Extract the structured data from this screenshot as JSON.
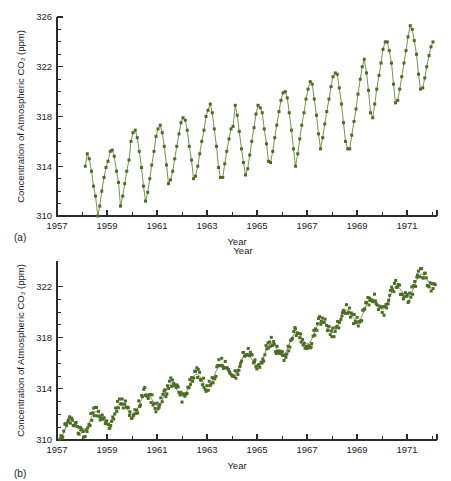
{
  "figure": {
    "panel_a_tag": "(a)",
    "panel_b_tag": "(b)",
    "marker_color": "#4e6b26",
    "line_color": "#5e7f30",
    "axis_color": "#2b2b2b"
  },
  "chart_data": [
    {
      "type": "scatter",
      "panel": "(a)",
      "title": "",
      "xlabel": "Year",
      "ylabel": "Concentration of Atmospheric CO2 (ppm)",
      "ylabel_display": "Concentration of Atmospheric CO₂ (ppm)",
      "xlim": [
        1957,
        1972.2
      ],
      "ylim": [
        310,
        326
      ],
      "ytick_labels": [
        "310",
        "314",
        "318",
        "322",
        "326"
      ],
      "yticks": [
        310,
        314,
        318,
        322,
        326
      ],
      "ytick_minor_step": 1,
      "xtick_labels": [
        "1957",
        "1959",
        "1961",
        "1963",
        "1965",
        "1967",
        "1969",
        "1971"
      ],
      "xticks": [
        1957,
        1959,
        1961,
        1963,
        1965,
        1967,
        1969,
        1971
      ],
      "xtick_minor_step": 1,
      "grid": false,
      "legend": "none",
      "series_name": "Monthly mean CO2",
      "connected": true,
      "x": [
        1958.13,
        1958.21,
        1958.29,
        1958.38,
        1958.46,
        1958.54,
        1958.63,
        1958.71,
        1958.79,
        1958.88,
        1958.96,
        1959.04,
        1959.13,
        1959.21,
        1959.29,
        1959.38,
        1959.46,
        1959.54,
        1959.63,
        1959.71,
        1959.79,
        1959.88,
        1959.96,
        1960.04,
        1960.13,
        1960.21,
        1960.29,
        1960.38,
        1960.46,
        1960.54,
        1960.63,
        1960.71,
        1960.79,
        1960.88,
        1960.96,
        1961.04,
        1961.13,
        1961.21,
        1961.29,
        1961.38,
        1961.46,
        1961.54,
        1961.63,
        1961.71,
        1961.79,
        1961.88,
        1961.96,
        1962.04,
        1962.13,
        1962.21,
        1962.29,
        1962.38,
        1962.46,
        1962.54,
        1962.63,
        1962.71,
        1962.79,
        1962.88,
        1962.96,
        1963.04,
        1963.13,
        1963.21,
        1963.29,
        1963.38,
        1963.46,
        1963.54,
        1963.63,
        1963.71,
        1963.79,
        1963.88,
        1963.96,
        1964.04,
        1964.13,
        1964.21,
        1964.29,
        1964.38,
        1964.46,
        1964.54,
        1964.63,
        1964.71,
        1964.79,
        1964.88,
        1964.96,
        1965.04,
        1965.13,
        1965.21,
        1965.29,
        1965.38,
        1965.46,
        1965.54,
        1965.63,
        1965.71,
        1965.79,
        1965.88,
        1965.96,
        1966.04,
        1966.13,
        1966.21,
        1966.29,
        1966.38,
        1966.46,
        1966.54,
        1966.63,
        1966.71,
        1966.79,
        1966.88,
        1966.96,
        1967.04,
        1967.13,
        1967.21,
        1967.29,
        1967.38,
        1967.46,
        1967.54,
        1967.63,
        1967.71,
        1967.79,
        1967.88,
        1967.96,
        1968.04,
        1968.13,
        1968.21,
        1968.29,
        1968.38,
        1968.46,
        1968.54,
        1968.63,
        1968.71,
        1968.79,
        1968.88,
        1968.96,
        1969.04,
        1969.13,
        1969.21,
        1969.29,
        1969.38,
        1969.46,
        1969.54,
        1969.63,
        1969.71,
        1969.79,
        1969.88,
        1969.96,
        1970.04,
        1970.13,
        1970.21,
        1970.29,
        1970.38,
        1970.46,
        1970.54,
        1970.63,
        1970.71,
        1970.79,
        1970.88,
        1970.96,
        1971.04,
        1971.13,
        1971.21,
        1971.29,
        1971.38,
        1971.46,
        1971.54,
        1971.63,
        1971.71,
        1971.79,
        1971.88,
        1971.96,
        1972.04
      ],
      "values": [
        314.0,
        315.0,
        314.6,
        313.6,
        312.4,
        311.6,
        310.0,
        310.8,
        312.0,
        313.1,
        313.9,
        314.4,
        315.2,
        315.3,
        314.8,
        313.6,
        312.7,
        310.8,
        311.6,
        312.6,
        313.6,
        314.5,
        316.0,
        316.7,
        316.9,
        316.3,
        315.2,
        313.9,
        312.4,
        311.2,
        311.9,
        313.0,
        314.1,
        315.2,
        316.4,
        317.0,
        317.3,
        316.7,
        315.6,
        314.1,
        312.6,
        312.9,
        313.6,
        314.6,
        315.6,
        316.6,
        317.5,
        317.9,
        317.7,
        316.9,
        315.6,
        314.5,
        313.0,
        313.2,
        314.0,
        315.0,
        316.0,
        316.9,
        318.0,
        318.5,
        319.0,
        318.3,
        317.0,
        315.6,
        313.9,
        313.1,
        313.1,
        314.2,
        315.2,
        316.2,
        317.0,
        317.2,
        318.9,
        318.1,
        316.8,
        315.4,
        314.3,
        313.3,
        313.8,
        314.9,
        316.0,
        317.1,
        318.2,
        318.9,
        318.7,
        318.3,
        317.0,
        315.8,
        314.4,
        314.3,
        315.2,
        316.3,
        317.3,
        318.4,
        319.3,
        319.9,
        320.0,
        319.5,
        318.3,
        316.9,
        315.4,
        314.0,
        315.0,
        316.2,
        317.3,
        318.3,
        319.4,
        320.2,
        320.8,
        320.6,
        319.4,
        318.1,
        316.6,
        315.4,
        316.3,
        317.4,
        318.4,
        319.4,
        320.4,
        321.2,
        321.5,
        321.4,
        320.3,
        319.0,
        317.5,
        316.0,
        315.4,
        315.4,
        316.5,
        317.6,
        318.6,
        319.8,
        321.0,
        322.0,
        322.6,
        321.5,
        320.1,
        318.3,
        317.9,
        319.0,
        320.2,
        321.3,
        322.3,
        323.4,
        324.0,
        324.0,
        323.3,
        322.3,
        320.6,
        319.1,
        319.3,
        320.2,
        321.2,
        322.3,
        323.3,
        324.4,
        325.3,
        325.0,
        324.1,
        323.0,
        321.4,
        320.2,
        320.3,
        321.1,
        322.0,
        322.9,
        323.6,
        324.0
      ]
    },
    {
      "type": "scatter",
      "panel": "(b)",
      "title": "",
      "xlabel": "Year",
      "xlabel_top": "Year",
      "ylabel": "Concentration of Atmospheric CO2 (ppm)",
      "ylabel_display": "Concentration of Atmospheric CO₂ (ppm)",
      "xlim": [
        1957,
        1972.2
      ],
      "ylim": [
        310,
        324
      ],
      "ytick_labels": [
        "310",
        "314",
        "318",
        "322"
      ],
      "yticks": [
        310,
        314,
        318,
        322
      ],
      "ytick_minor_step": 1,
      "xtick_labels": [
        "1957",
        "1959",
        "1961",
        "1963",
        "1965",
        "1967",
        "1969",
        "1971"
      ],
      "xticks": [
        1957,
        1959,
        1961,
        1963,
        1965,
        1967,
        1969,
        1971
      ],
      "xtick_minor_step": 1,
      "grid": false,
      "legend": "none",
      "series_name": "Weekly CO2 observations with fitted trend",
      "connected": false,
      "fit_curve_present": true,
      "scatter_noise": 0.45,
      "points_per_year": 26,
      "trend": {
        "start_year": 1957.1,
        "end_year": 1972.15,
        "start_value": 310.6,
        "end_value": 322.9,
        "seasonal_amplitude": 0.65
      }
    }
  ]
}
